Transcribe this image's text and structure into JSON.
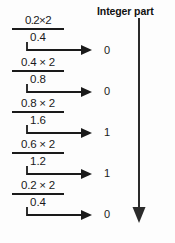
{
  "header": {
    "title": "Integer part"
  },
  "axis": {
    "name": "integer-part-arrow",
    "direction": "down"
  },
  "diagram": {
    "type": "decimal-to-binary-multiplication",
    "stroke_color": "#1a1a1a",
    "background_color": "#fdfdfd",
    "steps": [
      {
        "expression": "0.2×2",
        "product": "0.4",
        "integer_part": "0"
      },
      {
        "expression": "0.4 × 2",
        "product": "0.8",
        "integer_part": "0"
      },
      {
        "expression": "0.8 × 2",
        "product": "1.6",
        "integer_part": "1"
      },
      {
        "expression": "0.6 × 2",
        "product": "1.2",
        "integer_part": "1"
      },
      {
        "expression": "0.2 × 2",
        "product": "0.4",
        "integer_part": "0"
      }
    ]
  }
}
